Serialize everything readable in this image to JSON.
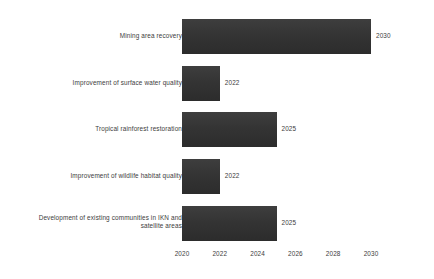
{
  "chart_data": {
    "type": "bar",
    "orientation": "horizontal",
    "title": "",
    "subtitle": "",
    "xlabel": "",
    "ylabel": "",
    "grid": false,
    "legend": null,
    "xlim": [
      2020,
      2031
    ],
    "x_ticks": [
      "2020",
      "2022",
      "2024",
      "2026",
      "2028",
      "2030"
    ],
    "x_tick_values": [
      2020,
      2022,
      2024,
      2026,
      2028,
      2030
    ],
    "bar_base": 2020,
    "bar_color": "#343434",
    "text_color": "#3c3c3c",
    "background_color": "#ffffff",
    "categories": [
      "Mining area recovery",
      "Improvement of surface water quality",
      "Tropical rainforest restoration",
      "Improvement of wildlife habitat quality",
      "Development of existing communities in IKN and\nsatellite areas"
    ],
    "values": [
      2030,
      2022,
      2025,
      2022,
      2025
    ],
    "value_labels": [
      "2030",
      "2022",
      "2025",
      "2022",
      "2025"
    ],
    "bars": [
      {
        "label": "Mining area recovery",
        "value": 2030,
        "value_label": "2030"
      },
      {
        "label": "Improvement of surface water quality",
        "value": 2022,
        "value_label": "2022"
      },
      {
        "label": "Tropical rainforest restoration",
        "value": 2025,
        "value_label": "2025"
      },
      {
        "label": "Improvement of wildlife habitat quality",
        "value": 2022,
        "value_label": "2022"
      },
      {
        "label": "Development of existing communities in IKN and\nsatellite areas",
        "value": 2025,
        "value_label": "2025"
      }
    ]
  }
}
